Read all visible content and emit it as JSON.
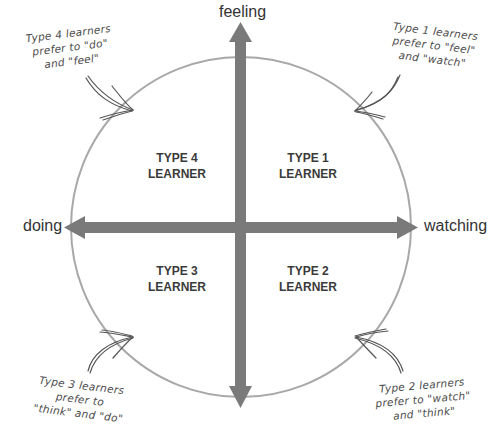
{
  "axes": {
    "top": "feeling",
    "left": "doing",
    "right": "watching"
  },
  "quadrants": {
    "top_left": {
      "line1": "TYPE 4",
      "line2": "LEARNER"
    },
    "top_right": {
      "line1": "TYPE 1",
      "line2": "LEARNER"
    },
    "bottom_left": {
      "line1": "TYPE 3",
      "line2": "LEARNER"
    },
    "bottom_right": {
      "line1": "TYPE 2",
      "line2": "LEARNER"
    }
  },
  "notes": {
    "top_left": {
      "line1": "Type 4 learners",
      "line2": "prefer to \"do\"",
      "line3": "and \"feel\""
    },
    "top_right": {
      "line1": "Type 1 learners",
      "line2": "prefer to \"feel\"",
      "line3": "and \"watch\""
    },
    "bottom_left": {
      "line1": "Type 3 learners",
      "line2": "prefer to",
      "line3": "\"think\" and \"do\""
    },
    "bottom_right": {
      "line1": "Type 2 learners",
      "line2": "prefer to \"watch\"",
      "line3": "and \"think\""
    }
  },
  "colors": {
    "circle": "#a8a8a8",
    "arrows": "#7a7a7a",
    "text": "#333333"
  }
}
